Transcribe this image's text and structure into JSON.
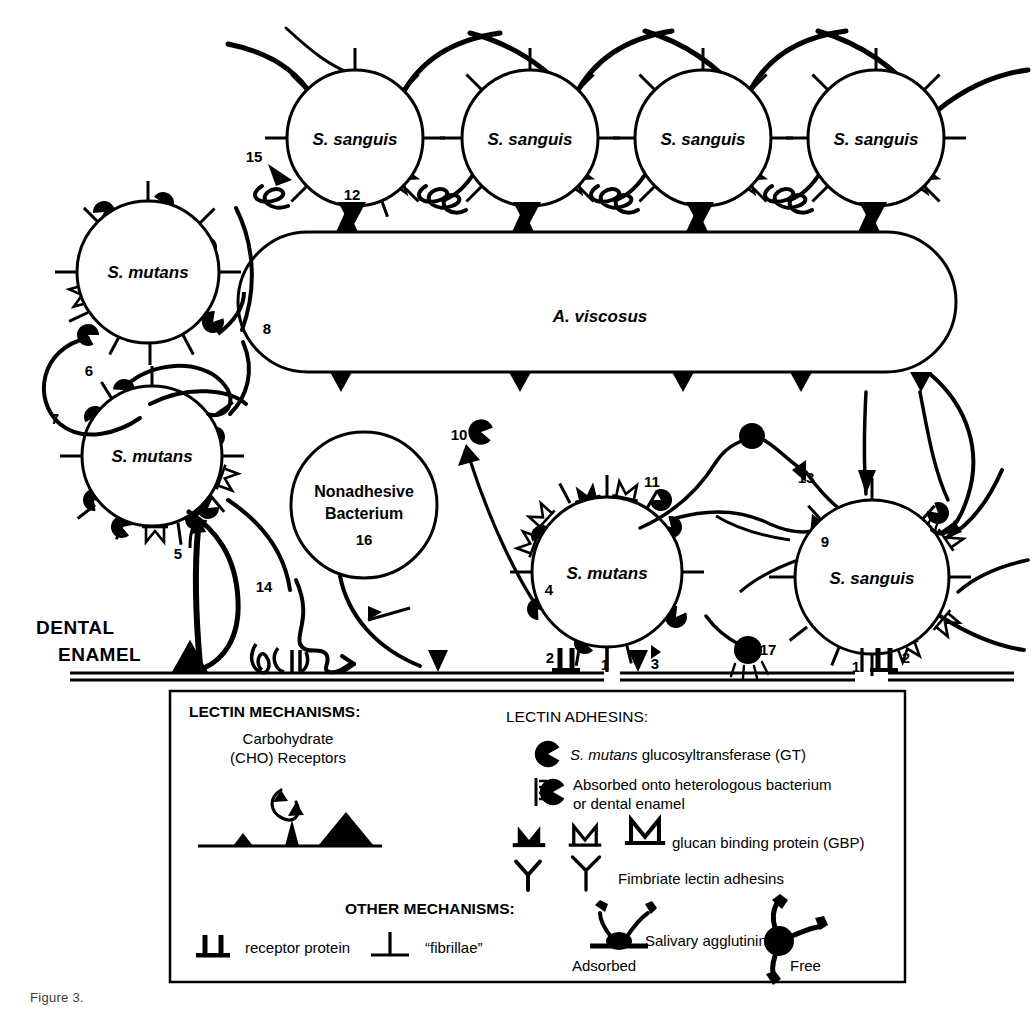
{
  "figure": {
    "caption_fragment": "Figure 3.",
    "background_color": "#ffffff",
    "ink_color": "#000000"
  },
  "surface": {
    "label_line1": "DENTAL",
    "label_line2": "ENAMEL"
  },
  "cells": [
    {
      "id": "s-sanguis-top-1",
      "name": "S. sanguis",
      "cx": 355,
      "cy": 138,
      "r": 68,
      "label_style": "italic"
    },
    {
      "id": "s-sanguis-top-2",
      "name": "S. sanguis",
      "cx": 530,
      "cy": 138,
      "r": 68,
      "label_style": "italic"
    },
    {
      "id": "s-sanguis-top-3",
      "name": "S. sanguis",
      "cx": 703,
      "cy": 138,
      "r": 68,
      "label_style": "italic"
    },
    {
      "id": "s-sanguis-top-4",
      "name": "S. sanguis",
      "cx": 876,
      "cy": 138,
      "r": 68,
      "label_style": "italic"
    },
    {
      "id": "s-mutans-upper-left",
      "name": "S. mutans",
      "cx": 148,
      "cy": 272,
      "r": 71,
      "label_style": "italic"
    },
    {
      "id": "s-mutans-lower-left",
      "name": "S. mutans",
      "cx": 152,
      "cy": 456,
      "r": 70,
      "label_style": "italic"
    },
    {
      "id": "nonadhesive-bacterium",
      "name": "Nonadhesive Bacterium",
      "cx": 364,
      "cy": 505,
      "r": 73,
      "label_style": "plain"
    },
    {
      "id": "s-mutans-center",
      "name": "S. mutans",
      "cx": 607,
      "cy": 572,
      "r": 75,
      "label_style": "italic"
    },
    {
      "id": "s-sanguis-right",
      "name": "S. sanguis",
      "cx": 872,
      "cy": 577,
      "r": 77,
      "label_style": "italic"
    }
  ],
  "rod_cell": {
    "id": "a-viscosus",
    "name": "A. viscosus",
    "x": 238,
    "y": 232,
    "width": 718,
    "height": 140,
    "radius": 70
  },
  "callouts": [
    {
      "n": "1",
      "x": 605,
      "y": 666
    },
    {
      "n": "2",
      "x": 557,
      "y": 661
    },
    {
      "n": "1",
      "x": 862,
      "y": 668
    },
    {
      "n": "2",
      "x": 905,
      "y": 661
    },
    {
      "n": "3",
      "x": 651,
      "y": 663
    },
    {
      "n": "4",
      "x": 549,
      "y": 591
    },
    {
      "n": "5",
      "x": 178,
      "y": 555
    },
    {
      "n": "6",
      "x": 89,
      "y": 372
    },
    {
      "n": "7",
      "x": 55,
      "y": 420
    },
    {
      "n": "8",
      "x": 267,
      "y": 330
    },
    {
      "n": "9",
      "x": 825,
      "y": 543
    },
    {
      "n": "10",
      "x": 461,
      "y": 436
    },
    {
      "n": "11",
      "x": 650,
      "y": 483
    },
    {
      "n": "12",
      "x": 352,
      "y": 196
    },
    {
      "n": "13",
      "x": 804,
      "y": 479
    },
    {
      "n": "14",
      "x": 264,
      "y": 588
    },
    {
      "n": "15",
      "x": 254,
      "y": 158
    },
    {
      "n": "16",
      "x": 364,
      "y": 541
    },
    {
      "n": "17",
      "x": 765,
      "y": 651
    }
  ],
  "legend": {
    "sections": {
      "lectin_mechanisms": {
        "heading": "LECTIN MECHANISMS:",
        "receptor_label_line1": "Carbohydrate",
        "receptor_label_line2": "(CHO) Receptors"
      },
      "lectin_adhesins": {
        "heading": "LECTIN ADHESINS:",
        "items": [
          {
            "icon": "gt-pacman-icon",
            "text_italic": "S. mutans",
            "text": " glucosyltransferase (GT)"
          },
          {
            "icon": "gt-adsorbed-icon",
            "text_line1": "Absorbed onto heterologous bacterium",
            "text_line2": "or dental enamel"
          },
          {
            "icon": "gbp-icon",
            "text": "glucan binding protein (GBP)"
          },
          {
            "icon": "fimbriae-icon",
            "text": "Fimbriate lectin adhesins"
          }
        ]
      },
      "other_mechanisms": {
        "heading": "OTHER MECHANISMS:",
        "items": [
          {
            "icon": "receptor-protein-icon",
            "text": "receptor protein"
          },
          {
            "icon": "fibrillae-icon",
            "text": "“fibrillae”"
          },
          {
            "icon": "salivary-agglutinin-icon",
            "text": "Salivary agglutinin",
            "sub_adsorbed": "Adsorbed",
            "sub_free": "Free"
          }
        ]
      }
    },
    "box": {
      "x": 170,
      "y": 691,
      "width": 735,
      "height": 291
    }
  }
}
